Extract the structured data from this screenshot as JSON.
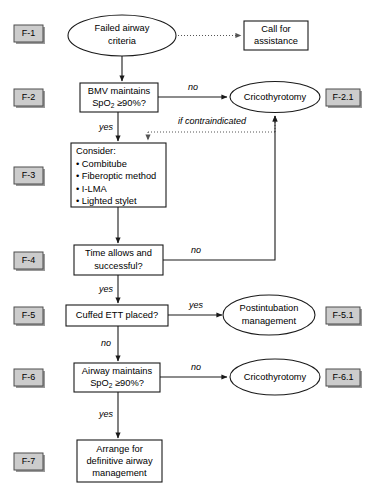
{
  "diagram": {
    "colors": {
      "stroke": "#1a1a1a",
      "node_fill": "#ffffff",
      "tag_fill": "#cccccc",
      "tag_border": "#4d4d4d",
      "dotted_edge": "#555555"
    }
  },
  "tags": {
    "f1": "F-1",
    "f2": "F-2",
    "f21": "F-2.1",
    "f3": "F-3",
    "f4": "F-4",
    "f5": "F-5",
    "f51": "F-5.1",
    "f6": "F-6",
    "f61": "F-6.1",
    "f7": "F-7"
  },
  "nodes": {
    "failed_airway": {
      "shape": "ellipse",
      "line1": "Failed airway",
      "line2": "criteria"
    },
    "call_assistance": {
      "shape": "rect",
      "line1": "Call for",
      "line2": "assistance"
    },
    "bmv": {
      "shape": "rect",
      "line1": "BMV maintains",
      "line2_pre": "SpO",
      "line2_sub": "2",
      "line2_post": " ≥90%?"
    },
    "crico_1": {
      "shape": "ellipse",
      "line1": "Cricothyrotomy"
    },
    "consider": {
      "shape": "rect",
      "heading": "Consider:",
      "items": [
        "• Combitube",
        "• Fiberoptic method",
        "• I-LMA",
        "• Lighted stylet"
      ]
    },
    "time_allows": {
      "shape": "rect",
      "line1": "Time allows and",
      "line2": "successful?"
    },
    "cuffed_ett": {
      "shape": "rect",
      "line1": "Cuffed ETT placed?"
    },
    "postintubation": {
      "shape": "ellipse",
      "line1": "Postintubation",
      "line2": "management"
    },
    "airway_maintains": {
      "shape": "rect",
      "line1": "Airway maintains",
      "line2_pre": "SpO",
      "line2_sub": "2",
      "line2_post": " ≥90%?"
    },
    "crico_2": {
      "shape": "ellipse",
      "line1": "Cricothyrotomy"
    },
    "arrange": {
      "shape": "rect",
      "line1": "Arrange for",
      "line2": "definitive airway",
      "line3": "management"
    }
  },
  "edges": {
    "bmv_no": "no",
    "bmv_yes": "yes",
    "if_contraindicated": "if contraindicated",
    "time_no": "no",
    "time_yes": "yes",
    "ett_yes": "yes",
    "ett_no": "no",
    "airway_no": "no",
    "airway_yes": "yes"
  }
}
